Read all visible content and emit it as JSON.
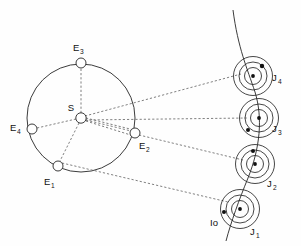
{
  "figure": {
    "background_color": "#fefefe",
    "line_color": "#262626",
    "dash_color": "#555555",
    "dot_color": "#111111"
  },
  "sun": {
    "label": "S",
    "label_x": 74,
    "label_y": 108,
    "cx": 81,
    "cy": 118,
    "r": 5.2
  },
  "earth_orbit": {
    "cx": 81,
    "cy": 118,
    "r": 54
  },
  "earth_positions": [
    {
      "label": "E",
      "subscript": "1",
      "cx": 58,
      "cy": 166,
      "r": 5.0,
      "label_x": 44,
      "label_y": 182,
      "sub_x": 51,
      "sub_y": 186
    },
    {
      "label": "E",
      "subscript": "2",
      "cx": 135,
      "cy": 133,
      "r": 5.0,
      "label_x": 139,
      "label_y": 146,
      "sub_x": 146,
      "sub_y": 150
    },
    {
      "label": "E",
      "subscript": "3",
      "cx": 81,
      "cy": 63,
      "r": 5.0,
      "label_x": 73,
      "label_y": 48,
      "sub_x": 80,
      "sub_y": 52
    },
    {
      "label": "E",
      "subscript": "4",
      "cx": 32,
      "cy": 129,
      "r": 5.0,
      "label_x": 14,
      "label_y": 128,
      "sub_x": 21,
      "sub_y": 132
    }
  ],
  "jupiter_positions": [
    {
      "label": "J",
      "subscript": "1",
      "cx": 240,
      "cy": 209,
      "rings": [
        8.5,
        14.0,
        19.5
      ],
      "center_dot_r": 1.9,
      "io_dot": {
        "cx": 224,
        "cy": 212,
        "r": 2.0
      },
      "label_x": 250,
      "label_y": 232,
      "sub_x": 256,
      "sub_y": 236
    },
    {
      "label": "J",
      "subscript": "2",
      "cx": 255,
      "cy": 164,
      "rings": [
        8.5,
        14.0,
        19.5
      ],
      "center_dot_r": 1.9,
      "io_dot": {
        "cx": 253,
        "cy": 151,
        "r": 2.0
      },
      "label_x": 267,
      "label_y": 184,
      "sub_x": 273,
      "sub_y": 188
    },
    {
      "label": "J",
      "subscript": "3",
      "cx": 259,
      "cy": 118,
      "rings": [
        8.5,
        14.0,
        19.5
      ],
      "center_dot_r": 1.9,
      "io_dot": {
        "cx": 248,
        "cy": 130,
        "r": 2.0
      },
      "label_x": 272,
      "label_y": 129,
      "sub_x": 278,
      "sub_y": 133
    },
    {
      "label": "J",
      "subscript": "4",
      "cx": 253,
      "cy": 76,
      "rings": [
        8.5,
        14.0,
        19.5
      ],
      "center_dot_r": 1.9,
      "io_dot": {
        "cx": 262,
        "cy": 66,
        "r": 2.2
      },
      "label_x": 272,
      "label_y": 78,
      "sub_x": 278,
      "sub_y": 82
    }
  ],
  "io_label": {
    "text": "Io",
    "x": 213,
    "y": 222
  },
  "sight_lines": [
    {
      "name": "E1-to-J1",
      "x1": 62,
      "y1": 163,
      "x2": 228,
      "y2": 202
    },
    {
      "name": "E2-to-J2",
      "x1": 139,
      "y1": 135,
      "x2": 243,
      "y2": 160
    },
    {
      "name": "E3-to-J3",
      "x1": 85,
      "y1": 120,
      "x2": 247,
      "y2": 118
    },
    {
      "name": "E4-to-J4",
      "x1": 85,
      "y1": 116,
      "x2": 241,
      "y2": 74
    }
  ],
  "sun_spokes": [
    {
      "name": "S-to-E1",
      "x1": 79,
      "y1": 123,
      "x2": 60,
      "y2": 161
    },
    {
      "name": "S-to-E2",
      "x1": 86,
      "y1": 120,
      "x2": 131,
      "y2": 131
    },
    {
      "name": "S-to-E3",
      "x1": 81,
      "y1": 113,
      "x2": 81,
      "y2": 68
    },
    {
      "name": "S-to-E4",
      "x1": 76,
      "y1": 119,
      "x2": 37,
      "y2": 128
    }
  ],
  "jupiter_arc": {
    "name": "jupiter-orbit-arc",
    "path": "M 233 10 C 238 48, 247 68, 255 92 C 263 118, 260 148, 248 178 C 239 200, 231 222, 226 241"
  }
}
